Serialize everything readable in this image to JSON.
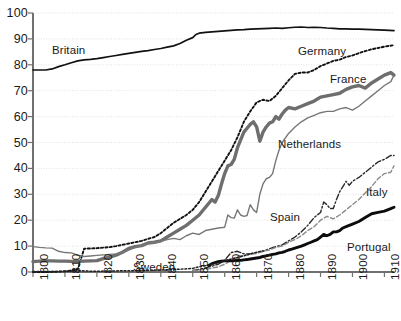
{
  "chart_data": {
    "type": "line",
    "title": "",
    "subtitle": "",
    "xlabel": "",
    "ylabel": "",
    "xlim": [
      1800,
      1913
    ],
    "ylim": [
      0,
      100
    ],
    "grid": true,
    "legend_position": "inline-labels",
    "y_ticks": [
      0,
      10,
      20,
      30,
      40,
      50,
      60,
      70,
      80,
      90,
      100
    ],
    "y_tick_labels": [
      "0",
      "10",
      "20",
      "30",
      "40",
      "50",
      "60",
      "70",
      "80",
      "90",
      "100"
    ],
    "x_ticks": [
      1800,
      1810,
      1820,
      1830,
      1840,
      1850,
      1860,
      1870,
      1880,
      1890,
      1900,
      1910
    ],
    "x_tick_labels": [
      "1800",
      "1810",
      "1820",
      "1830",
      "1840",
      "1850",
      "1860",
      "1870",
      "1880",
      "1890",
      "1900",
      "1910"
    ],
    "series": [
      {
        "name": "Britain",
        "label": "Britain",
        "style": "solid-thin-black",
        "color": "#111111",
        "width": 1.7,
        "dash": "",
        "label_x": 52,
        "label_y": 44,
        "x": [
          1800,
          1802,
          1804,
          1806,
          1808,
          1810,
          1812,
          1814,
          1816,
          1818,
          1820,
          1822,
          1824,
          1826,
          1828,
          1830,
          1832,
          1834,
          1836,
          1838,
          1840,
          1842,
          1844,
          1846,
          1848,
          1850,
          1851,
          1852,
          1854,
          1856,
          1858,
          1860,
          1862,
          1864,
          1866,
          1868,
          1870,
          1872,
          1874,
          1876,
          1878,
          1880,
          1882,
          1884,
          1886,
          1888,
          1890,
          1892,
          1894,
          1896,
          1898,
          1900,
          1902,
          1904,
          1906,
          1908,
          1910,
          1913
        ],
        "y": [
          78,
          78,
          78,
          78.4,
          79.3,
          80,
          80.8,
          81.5,
          81.9,
          82.1,
          82.4,
          82.8,
          83.2,
          83.6,
          84,
          84.4,
          84.8,
          85.2,
          85.5,
          85.9,
          86.3,
          86.8,
          87.3,
          88.2,
          89.5,
          90.5,
          91.7,
          92.2,
          92.5,
          92.7,
          92.9,
          93.1,
          93.3,
          93.5,
          93.6,
          93.8,
          93.9,
          94,
          94.1,
          94.2,
          94.1,
          94.3,
          94.5,
          94.6,
          94.4,
          94.5,
          94.4,
          94.2,
          94.1,
          93.9,
          93.9,
          93.8,
          93.8,
          93.7,
          93.6,
          93.5,
          93.4,
          93.2
        ]
      },
      {
        "name": "Germany",
        "label": "Germany",
        "style": "dotted-black",
        "color": "#111111",
        "width": 1.9,
        "dash": "2.2,2.2",
        "label_x": 298,
        "label_y": 45,
        "x": [
          1800,
          1805,
          1810,
          1812,
          1814,
          1816,
          1818,
          1820,
          1822,
          1824,
          1826,
          1828,
          1830,
          1832,
          1834,
          1836,
          1838,
          1840,
          1842,
          1844,
          1846,
          1848,
          1850,
          1852,
          1854,
          1856,
          1858,
          1860,
          1862,
          1864,
          1866,
          1868,
          1870,
          1872,
          1874,
          1876,
          1878,
          1880,
          1882,
          1884,
          1886,
          1888,
          1890,
          1892,
          1894,
          1896,
          1898,
          1900,
          1902,
          1904,
          1906,
          1908,
          1910,
          1913
        ],
        "y": [
          0,
          0,
          0.3,
          0.6,
          0.9,
          9,
          9.1,
          9.2,
          9.4,
          9.6,
          10,
          10.5,
          11,
          11.5,
          12,
          12.8,
          13.5,
          15,
          17,
          19,
          20.5,
          22,
          24,
          27,
          31,
          35,
          39,
          43,
          47,
          52,
          58,
          62,
          65.5,
          66.5,
          66,
          68,
          71,
          74,
          76.5,
          77,
          77,
          78,
          79.5,
          80.5,
          81.5,
          82,
          83,
          83.6,
          84.5,
          85.3,
          86,
          86.5,
          87,
          87.6
        ]
      },
      {
        "name": "France",
        "label": "France",
        "style": "solid-thick-gray",
        "color": "#6e6e6e",
        "width": 3.4,
        "dash": "",
        "label_x": 330,
        "label_y": 73,
        "x": [
          1800,
          1802,
          1804,
          1806,
          1808,
          1810,
          1812,
          1814,
          1816,
          1818,
          1820,
          1822,
          1824,
          1826,
          1828,
          1830,
          1832,
          1834,
          1836,
          1838,
          1840,
          1842,
          1844,
          1846,
          1848,
          1850,
          1852,
          1854,
          1856,
          1857,
          1858,
          1859,
          1860,
          1861,
          1862,
          1863,
          1864,
          1865,
          1866,
          1867,
          1868,
          1869,
          1870,
          1871,
          1872,
          1873,
          1874,
          1875,
          1876,
          1877,
          1878,
          1879,
          1880,
          1882,
          1884,
          1886,
          1888,
          1890,
          1892,
          1894,
          1896,
          1898,
          1900,
          1902,
          1904,
          1906,
          1908,
          1910,
          1912,
          1913
        ],
        "y": [
          4,
          4.2,
          4.3,
          4.3,
          4.2,
          4.2,
          4.1,
          4.1,
          4.2,
          4.3,
          4.4,
          5.2,
          5.7,
          6.5,
          7.6,
          9.1,
          9.8,
          10.2,
          11.2,
          11.5,
          12,
          13.5,
          15,
          16.5,
          18,
          20,
          22,
          25,
          28,
          27,
          29.5,
          34,
          38,
          41,
          41.5,
          43.5,
          48,
          51,
          54,
          55.5,
          57,
          58,
          56,
          50.5,
          54,
          56,
          57.5,
          58,
          60,
          59,
          61,
          62.5,
          63.5,
          63,
          64,
          65,
          66,
          67.5,
          68,
          68.5,
          69,
          70.5,
          71.5,
          72,
          71,
          73,
          74.5,
          76,
          77,
          76
        ]
      },
      {
        "name": "Netherlands",
        "label": "Netherlands",
        "style": "solid-thin-gray",
        "color": "#777777",
        "width": 1.4,
        "dash": "",
        "label_x": 278,
        "label_y": 138,
        "x": [
          1800,
          1802,
          1804,
          1806,
          1808,
          1810,
          1812,
          1814,
          1816,
          1818,
          1820,
          1822,
          1824,
          1826,
          1828,
          1830,
          1832,
          1834,
          1836,
          1838,
          1840,
          1842,
          1844,
          1846,
          1848,
          1850,
          1852,
          1854,
          1856,
          1858,
          1860,
          1861,
          1862,
          1863,
          1864,
          1865,
          1866,
          1867,
          1868,
          1869,
          1870,
          1871,
          1872,
          1873,
          1874,
          1875,
          1876,
          1877,
          1878,
          1880,
          1882,
          1884,
          1886,
          1888,
          1890,
          1892,
          1894,
          1896,
          1898,
          1900,
          1902,
          1904,
          1906,
          1908,
          1910,
          1912,
          1913
        ],
        "y": [
          9.8,
          9.5,
          9.3,
          9.2,
          8,
          7.5,
          7.4,
          6.5,
          6,
          6.2,
          6.4,
          6.6,
          6.8,
          7,
          7.5,
          8.5,
          9.5,
          10.2,
          11.2,
          11.4,
          11.8,
          12.5,
          13,
          12.5,
          14,
          15,
          14.5,
          16,
          16.5,
          17,
          17.3,
          22,
          21,
          20.8,
          24,
          22,
          21.5,
          21.8,
          26,
          24,
          23,
          30,
          34,
          36,
          36.5,
          38,
          43,
          47,
          50,
          53.5,
          56,
          58,
          59.5,
          60.5,
          61.5,
          62,
          62,
          63,
          63.5,
          62.5,
          64,
          66,
          68,
          70,
          72,
          73.5,
          76
        ]
      },
      {
        "name": "Spain",
        "label": "Spain",
        "style": "dashdot-dark",
        "color": "#2a2a2a",
        "width": 1.4,
        "dash": "6,2.2,1.6,2.2",
        "label_x": 270,
        "label_y": 211,
        "x": [
          1850,
          1852,
          1854,
          1856,
          1858,
          1860,
          1862,
          1864,
          1866,
          1868,
          1870,
          1872,
          1874,
          1876,
          1878,
          1880,
          1882,
          1884,
          1886,
          1888,
          1890,
          1891,
          1892,
          1893,
          1894,
          1895,
          1896,
          1897,
          1898,
          1899,
          1900,
          1902,
          1904,
          1906,
          1908,
          1910,
          1912,
          1913
        ],
        "y": [
          0.6,
          1,
          1.6,
          2.2,
          3,
          4.5,
          7.5,
          8,
          7,
          7,
          7.5,
          8,
          9,
          9.8,
          10.5,
          12,
          13.5,
          15.5,
          18,
          21,
          23,
          27,
          26,
          24.5,
          24.5,
          28,
          31,
          33,
          35,
          33.5,
          35,
          36.5,
          38.5,
          40.5,
          42.5,
          43.5,
          45,
          45
        ]
      },
      {
        "name": "Italy",
        "label": "Italy",
        "style": "dashed-gray",
        "color": "#8a8a8a",
        "width": 1.4,
        "dash": "4.5,2.4",
        "label_x": 366,
        "label_y": 186,
        "x": [
          1850,
          1854,
          1858,
          1860,
          1862,
          1864,
          1866,
          1868,
          1870,
          1872,
          1874,
          1876,
          1878,
          1880,
          1882,
          1884,
          1886,
          1888,
          1890,
          1892,
          1894,
          1896,
          1898,
          1900,
          1902,
          1904,
          1906,
          1908,
          1910,
          1912,
          1913
        ],
        "y": [
          0.5,
          1,
          2,
          3,
          4.5,
          6,
          6.5,
          6.8,
          7.2,
          8,
          8.5,
          9.5,
          10,
          11.5,
          12.5,
          14,
          16,
          17.5,
          20,
          21.5,
          20.5,
          22,
          24,
          26,
          28,
          30.5,
          33,
          36,
          38,
          38.5,
          41
        ]
      },
      {
        "name": "Portugal",
        "label": "Portugal",
        "style": "solid-thick-black",
        "color": "#0c0c0c",
        "width": 2.9,
        "dash": "",
        "label_x": 347,
        "label_y": 241,
        "x": [
          1855,
          1856,
          1857,
          1858,
          1859,
          1860,
          1861,
          1862,
          1863,
          1864,
          1865,
          1866,
          1867,
          1868,
          1869,
          1870,
          1871,
          1872,
          1873,
          1874,
          1875,
          1876,
          1877,
          1878,
          1879,
          1880,
          1881,
          1882,
          1883,
          1884,
          1885,
          1886,
          1887,
          1888,
          1889,
          1890,
          1891,
          1892,
          1893,
          1894,
          1895,
          1896,
          1897,
          1898,
          1899,
          1900,
          1902,
          1904,
          1906,
          1908,
          1910,
          1912,
          1913
        ],
        "y": [
          2.5,
          3.2,
          3.6,
          4,
          4.2,
          4.3,
          4.4,
          4.3,
          4.4,
          4.6,
          4.5,
          4.7,
          4.8,
          5,
          5.2,
          5.4,
          5.6,
          6,
          6.2,
          6.5,
          6.8,
          7,
          7.4,
          7.6,
          8,
          8.5,
          8.8,
          9.2,
          9.6,
          10,
          10.5,
          11,
          11.5,
          12,
          12.5,
          13.5,
          14.5,
          14,
          14.5,
          15.5,
          15.5,
          16,
          17,
          17.5,
          18,
          18.5,
          19.5,
          21,
          22.5,
          23,
          23.5,
          24.5,
          25
        ]
      },
      {
        "name": "Sweden",
        "label": "Sweden",
        "style": "dotted-fine-black",
        "color": "#222222",
        "width": 1.5,
        "dash": "1.8,2.0",
        "label_x": 133,
        "label_y": 261,
        "x": [
          1800,
          1810,
          1815,
          1818,
          1820,
          1825,
          1830,
          1835,
          1840,
          1845,
          1850,
          1852,
          1854,
          1856,
          1858,
          1860,
          1862,
          1864,
          1866,
          1868,
          1870,
          1872
        ],
        "y": [
          0.2,
          0.2,
          0.5,
          0.3,
          0.3,
          0.4,
          0.5,
          0.6,
          0.8,
          1,
          1.4,
          2,
          2.4,
          3,
          3.5,
          4.2,
          5,
          5.6,
          6.2,
          7,
          7.6,
          8.2
        ]
      }
    ]
  },
  "axes": {
    "axis_color": "#707070",
    "grid_color": "#d9d9d9",
    "tick_color": "#707070"
  }
}
